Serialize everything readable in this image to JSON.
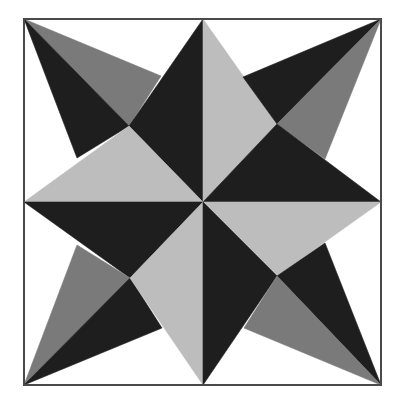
{
  "diagram": {
    "title": "Eight-point star quilt block",
    "colors": {
      "background": "#ffffff",
      "border": "#4a4a4a",
      "dark": "#1e1e1e",
      "medium": "#7a7a7a",
      "light": "#bdbdbd",
      "white": "#ffffff"
    },
    "frame": {
      "x": 24,
      "y": 19,
      "width": 357,
      "height": 366
    },
    "pieces": [
      {
        "name": "tl-outer-medium",
        "fill": "medium",
        "points": "24,19 161,76 129,126"
      },
      {
        "name": "tl-outer-dark",
        "fill": "dark",
        "points": "24,19 129,126 77,158"
      },
      {
        "name": "tl-inner-dark",
        "fill": "dark",
        "points": "203,19 129,126 203,202"
      },
      {
        "name": "tl-inner-light",
        "fill": "light",
        "points": "24,202 129,126 203,202"
      },
      {
        "name": "tr-inner-light",
        "fill": "light",
        "points": "203,19 203,202 277,124"
      },
      {
        "name": "tr-outer-dark",
        "fill": "dark",
        "points": "381,19 243,77 277,124"
      },
      {
        "name": "tr-outer-medium",
        "fill": "medium",
        "points": "381,19 277,124 325,159"
      },
      {
        "name": "tr-inner-dark",
        "fill": "dark",
        "points": "381,202 277,124 203,202"
      },
      {
        "name": "bl-inner-dark",
        "fill": "dark",
        "points": "24,202 203,202 130,278"
      },
      {
        "name": "bl-outer-medium",
        "fill": "medium",
        "points": "24,385 130,278 77,245"
      },
      {
        "name": "bl-outer-dark",
        "fill": "dark",
        "points": "24,385 130,278 162,328"
      },
      {
        "name": "bl-inner-light",
        "fill": "light",
        "points": "203,385 203,202 130,278"
      },
      {
        "name": "br-inner-light",
        "fill": "light",
        "points": "381,202 203,202 277,276"
      },
      {
        "name": "br-inner-dark",
        "fill": "dark",
        "points": "203,385 203,202 277,276"
      },
      {
        "name": "br-outer-dark",
        "fill": "dark",
        "points": "381,385 277,276 325,243"
      },
      {
        "name": "br-outer-medium",
        "fill": "medium",
        "points": "381,385 277,276 244,328"
      }
    ]
  }
}
